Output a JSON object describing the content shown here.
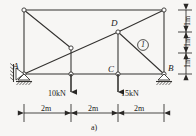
{
  "figure": {
    "caption": "a)",
    "type": "truss-free-body-diagram",
    "nodes": [
      {
        "id": "A",
        "label": "A",
        "x": 24,
        "y": 74
      },
      {
        "id": "B",
        "label": "B",
        "x": 164,
        "y": 74
      },
      {
        "id": "C",
        "label": "C",
        "x": 118,
        "y": 74
      },
      {
        "id": "D",
        "label": "D",
        "x": 118,
        "y": 32
      },
      {
        "id": "TL",
        "label": "",
        "x": 24,
        "y": 10
      },
      {
        "id": "TR",
        "label": "",
        "x": 164,
        "y": 10
      },
      {
        "id": "E",
        "label": "",
        "x": 71,
        "y": 48
      },
      {
        "id": "F",
        "label": "",
        "x": 71,
        "y": 74
      }
    ],
    "members": [
      {
        "from": "TL",
        "to": "TR",
        "name": "top-chord"
      },
      {
        "from": "A",
        "to": "B",
        "name": "bottom-chord"
      },
      {
        "from": "TL",
        "to": "A",
        "name": "left-vertical"
      },
      {
        "from": "TR",
        "to": "B",
        "name": "right-vertical"
      },
      {
        "from": "E",
        "to": "F",
        "name": "mid-vertical"
      },
      {
        "from": "D",
        "to": "C",
        "name": "node-d-vertical"
      },
      {
        "from": "TL",
        "to": "E",
        "name": "upper-left-diagonal"
      },
      {
        "from": "A",
        "to": "D",
        "name": "long-diagonal"
      },
      {
        "from": "D",
        "to": "TR",
        "name": "upper-right-diagonal"
      },
      {
        "from": "D",
        "to": "B",
        "name": "member-one-diagonal"
      }
    ],
    "member_label": {
      "text": "1",
      "circled": true,
      "x": 141,
      "y": 46
    },
    "loads": [
      {
        "label": "10kN",
        "at_node": "F",
        "x": 71,
        "y": 74,
        "length": 22,
        "label_x": 48,
        "label_y": 94
      },
      {
        "label": "15kN",
        "at_node": "C",
        "x": 118,
        "y": 74,
        "length": 22,
        "label_x": 121,
        "label_y": 94
      }
    ],
    "supports": [
      {
        "type": "pin-roller",
        "node": "A",
        "x": 24,
        "y": 74
      },
      {
        "type": "roller",
        "node": "B",
        "x": 164,
        "y": 74
      }
    ],
    "horizontal_dimensions": {
      "y": 115,
      "segments": [
        {
          "label": "2m",
          "from_x": 24,
          "to_x": 71
        },
        {
          "label": "2m",
          "from_x": 71,
          "to_x": 118
        },
        {
          "label": "2m",
          "from_x": 118,
          "to_x": 164
        }
      ]
    },
    "vertical_dimensions": {
      "x": 186,
      "segments": [
        {
          "label": "1m",
          "from_y": 10,
          "to_y": 32
        },
        {
          "label": "1m",
          "from_y": 32,
          "to_y": 53
        },
        {
          "label": "1m",
          "from_y": 53,
          "to_y": 74
        }
      ]
    },
    "colors": {
      "line": "#33312f",
      "background": "#f7f6f4",
      "text": "#1a1a1a"
    }
  }
}
